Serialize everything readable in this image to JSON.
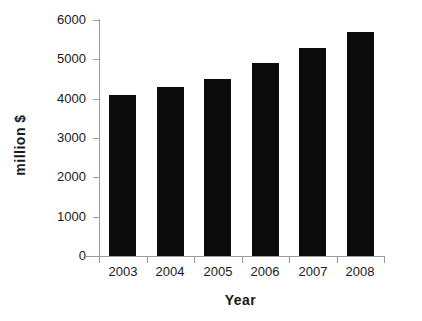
{
  "chart_data": {
    "type": "bar",
    "title": "",
    "subtitle": "",
    "categories": [
      "2003",
      "2004",
      "2005",
      "2006",
      "2007",
      "2008"
    ],
    "values": [
      4100,
      4300,
      4500,
      4900,
      5300,
      5700
    ],
    "series": [
      {
        "name": "Revenue",
        "values": [
          4100,
          4300,
          4500,
          4900,
          5300,
          5700
        ]
      }
    ],
    "xlabel": "Year",
    "ylabel": "million  $",
    "ylim": [
      0,
      6000
    ],
    "ytick_labels": [
      "0",
      "1000",
      "2000",
      "3000",
      "4000",
      "5000",
      "6000"
    ],
    "ytick_values": [
      0,
      1000,
      2000,
      3000,
      4000,
      5000,
      6000
    ],
    "grid": false,
    "legend": "none",
    "bar_color": "#0b0b0b",
    "axis_color": "#9a9a9a",
    "background": "#ffffff"
  },
  "axes": {
    "x_title": "Year",
    "y_title": "million  $"
  }
}
